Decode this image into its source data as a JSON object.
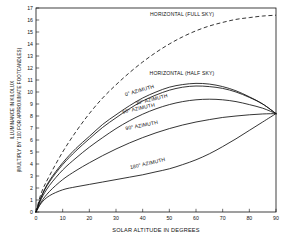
{
  "chart_data": {
    "type": "line",
    "title": "",
    "xlabel": "SOLAR ALTITUDE IN DEGREES",
    "ylabel_line1": "ILLUMINANCE IN KILOLUX",
    "ylabel_line2": "(MULTIPLY BY '100 FOR APPROXIMATE FOOTCANDLES)",
    "xlim": [
      0,
      90
    ],
    "ylim": [
      0,
      17
    ],
    "xticks": [
      0,
      10,
      20,
      30,
      40,
      50,
      60,
      70,
      80,
      90
    ],
    "yticks": [
      0,
      1,
      2,
      3,
      4,
      5,
      6,
      7,
      8,
      9,
      10,
      11,
      12,
      13,
      14,
      15,
      16,
      17
    ],
    "grid": false,
    "legend": "inline-annotations",
    "x": [
      0,
      2,
      5,
      10,
      15,
      20,
      25,
      30,
      35,
      40,
      45,
      50,
      55,
      60,
      65,
      70,
      75,
      80,
      85,
      90
    ],
    "series": [
      {
        "name": "HORIZONTAL (FULL SKY)",
        "style": "dashed",
        "values": [
          0,
          1.6,
          3.0,
          5.0,
          6.7,
          8.2,
          9.5,
          10.6,
          11.6,
          12.5,
          13.3,
          14.0,
          14.6,
          15.1,
          15.5,
          15.8,
          16.05,
          16.2,
          16.33,
          16.4
        ]
      },
      {
        "name": "0° AZIMUTH",
        "style": "solid",
        "values": [
          0,
          1.3,
          2.6,
          4.1,
          5.3,
          6.3,
          7.3,
          8.1,
          8.85,
          9.5,
          10.0,
          10.4,
          10.62,
          10.72,
          10.66,
          10.45,
          10.1,
          9.6,
          9.0,
          8.2
        ]
      },
      {
        "name": "30° AZIMUTH",
        "style": "solid",
        "values": [
          0,
          1.25,
          2.5,
          3.95,
          5.1,
          6.1,
          7.05,
          7.85,
          8.6,
          9.25,
          9.75,
          10.15,
          10.4,
          10.5,
          10.45,
          10.3,
          10.0,
          9.55,
          9.0,
          8.2
        ]
      },
      {
        "name": "60° AZIMUTH",
        "style": "solid",
        "values": [
          0,
          1.1,
          2.2,
          3.5,
          4.5,
          5.4,
          6.2,
          6.95,
          7.6,
          8.15,
          8.6,
          8.95,
          9.2,
          9.35,
          9.4,
          9.35,
          9.2,
          8.95,
          8.65,
          8.2
        ]
      },
      {
        "name": "90° AZIMUTH",
        "style": "solid",
        "values": [
          0,
          0.85,
          1.7,
          2.7,
          3.45,
          4.1,
          4.7,
          5.25,
          5.75,
          6.2,
          6.6,
          6.95,
          7.25,
          7.5,
          7.7,
          7.88,
          8.0,
          8.1,
          8.17,
          8.2
        ]
      },
      {
        "name": "180° AZIMUTH",
        "style": "solid",
        "values": [
          0,
          0.75,
          1.35,
          1.85,
          2.1,
          2.3,
          2.5,
          2.7,
          2.9,
          3.1,
          3.35,
          3.6,
          3.95,
          4.35,
          4.85,
          5.45,
          6.1,
          6.8,
          7.5,
          8.2
        ]
      }
    ],
    "annotations": [
      {
        "text": "HORIZONTAL (FULL SKY)",
        "x_px": 182,
        "y_px": 16,
        "rotate": 0
      },
      {
        "text": "HORIZONTAL (HALF SKY)",
        "x_px": 182,
        "y_px": 75,
        "rotate": 0
      },
      {
        "text": "0° AZIMUTH",
        "x_px": 140,
        "y_px": 92,
        "rotate": -16
      },
      {
        "text": "30° AZIMUTH",
        "x_px": 152,
        "y_px": 101,
        "rotate": -14
      },
      {
        "text": "60° AZIMUTH",
        "x_px": 139,
        "y_px": 110,
        "rotate": -13
      },
      {
        "text": "90° AZIMUTH",
        "x_px": 142,
        "y_px": 127,
        "rotate": -11
      },
      {
        "text": "180° AZIMUTH",
        "x_px": 148,
        "y_px": 165,
        "rotate": -13
      }
    ]
  }
}
